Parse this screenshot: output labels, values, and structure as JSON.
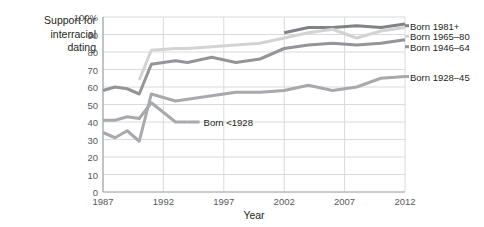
{
  "chart_data": {
    "type": "line",
    "title": "",
    "ylabel": "Support for interracial dating",
    "xlabel": "Year",
    "xlim": [
      1987,
      2012
    ],
    "ylim": [
      0,
      100
    ],
    "grid": true,
    "legend_position": "right-inline",
    "ytick_labels": [
      "100%",
      "90",
      "80",
      "70",
      "60",
      "50",
      "40",
      "30",
      "20",
      "10",
      "0"
    ],
    "ytick_values": [
      100,
      90,
      80,
      70,
      60,
      50,
      40,
      30,
      20,
      10,
      0
    ],
    "xtick_labels": [
      "1987",
      "1992",
      "1997",
      "2002",
      "2007",
      "2012"
    ],
    "xtick_values": [
      1987,
      1992,
      1997,
      2002,
      2007,
      2012
    ],
    "series": [
      {
        "name": "Born 1981+",
        "color": "#808285",
        "label_y": 95,
        "x": [
          2002,
          2004,
          2006,
          2008,
          2010,
          2012
        ],
        "values": [
          91,
          94,
          94,
          95,
          94,
          96
        ]
      },
      {
        "name": "Born 1965–80",
        "color": "#d1d3d4",
        "label_y": 89,
        "x": [
          1990,
          1991,
          1993,
          1994,
          1996,
          1998,
          2000,
          2002,
          2004,
          2006,
          2008,
          2010,
          2012
        ],
        "values": [
          64,
          81,
          82,
          82,
          83,
          84,
          85,
          88,
          91,
          93,
          88,
          92,
          94
        ]
      },
      {
        "name": "Born 1946–64",
        "color": "#939598",
        "label_y": 83,
        "x": [
          1987,
          1988,
          1989,
          1990,
          1991,
          1993,
          1994,
          1996,
          1998,
          2000,
          2002,
          2004,
          2006,
          2008,
          2010,
          2012
        ],
        "values": [
          58,
          60,
          59,
          56,
          73,
          75,
          74,
          77,
          74,
          76,
          82,
          84,
          85,
          84,
          85,
          87
        ]
      },
      {
        "name": "Born 1928–45",
        "color": "#a7a9ac",
        "label_y": 66,
        "x": [
          1987,
          1988,
          1989,
          1990,
          1991,
          1993,
          1994,
          1996,
          1998,
          2000,
          2002,
          2004,
          2006,
          2008,
          2010,
          2012
        ],
        "values": [
          34,
          31,
          35,
          29,
          56,
          52,
          53,
          55,
          57,
          57,
          58,
          61,
          58,
          60,
          65,
          66
        ]
      },
      {
        "name": "Born <1928",
        "color": "#a7a9ac",
        "label_y": 40,
        "x": [
          1987,
          1988,
          1989,
          1990,
          1991,
          1993,
          1994
        ],
        "values": [
          41,
          41,
          43,
          42,
          51,
          40,
          40
        ]
      }
    ]
  },
  "axis": {
    "y_title": "Support for\ninterracial\ndating",
    "y_title_lines": [
      "Support for",
      "interracial",
      "dating"
    ],
    "x_title": "Year"
  },
  "legend": {
    "items": [
      {
        "label": "Born 1981+"
      },
      {
        "label": "Born 1965–80"
      },
      {
        "label": "Born 1946–64"
      },
      {
        "label": "Born 1928–45"
      }
    ],
    "inline": {
      "label": "Born <1928"
    }
  },
  "colors": {
    "grid": "#d9dadb",
    "axis": "#a6a8ab",
    "text": "#231f20",
    "tick_text": "#58595b",
    "background": "#ffffff"
  }
}
